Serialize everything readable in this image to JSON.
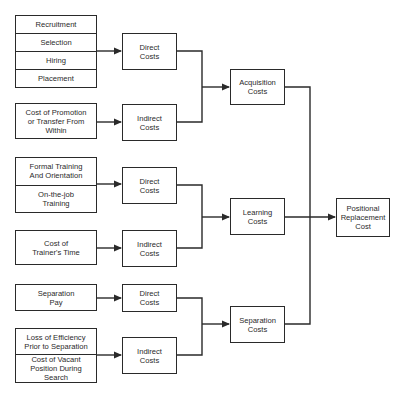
{
  "diagram": {
    "source_groups": {
      "acq_direct_items": [
        "Recruitment",
        "Selection",
        "Hiring",
        "Placement"
      ],
      "acq_indirect_items": [
        "Cost of Promotion or Transfer From Within"
      ],
      "learn_direct_items": [
        "Formal Training And Orientation",
        "On-the-job Training"
      ],
      "learn_indirect_items": [
        "Cost of Trainer's Time"
      ],
      "sep_direct_items": [
        "Separation Pay"
      ],
      "sep_indirect_items": [
        "Loss of Efficiency Prior to Separation",
        "Cost of Vacant Position During Search"
      ]
    },
    "cost_types": {
      "acq_direct": "Direct Costs",
      "acq_indirect": "Indirect Costs",
      "learn_direct": "Direct Costs",
      "learn_indirect": "Indirect Costs",
      "sep_direct": "Direct Costs",
      "sep_indirect": "Indirect Costs"
    },
    "categories": {
      "acquisition": "Acquisition Costs",
      "learning": "Learning Costs",
      "separation": "Separation Costs"
    },
    "result": "Positional Replacement Cost",
    "edges": [
      [
        "acq_direct_items",
        "acq_direct"
      ],
      [
        "acq_indirect_items",
        "acq_indirect"
      ],
      [
        "learn_direct_items",
        "learn_direct"
      ],
      [
        "learn_indirect_items",
        "learn_indirect"
      ],
      [
        "sep_direct_items",
        "sep_direct"
      ],
      [
        "sep_indirect_items",
        "sep_indirect"
      ],
      [
        "acq_direct",
        "acquisition"
      ],
      [
        "acq_indirect",
        "acquisition"
      ],
      [
        "learn_direct",
        "learning"
      ],
      [
        "learn_indirect",
        "learning"
      ],
      [
        "sep_direct",
        "separation"
      ],
      [
        "sep_indirect",
        "separation"
      ],
      [
        "acquisition",
        "result"
      ],
      [
        "learning",
        "result"
      ],
      [
        "separation",
        "result"
      ]
    ],
    "colors": {
      "line": "#2a2a2a",
      "background": "#ffffff"
    }
  }
}
